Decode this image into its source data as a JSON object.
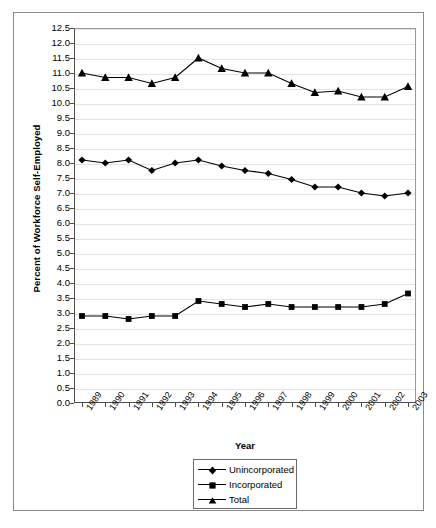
{
  "chart_data": {
    "type": "line",
    "title": "",
    "xlabel": "Year",
    "ylabel": "Percent of Workforce Self-Employed",
    "categories": [
      "1989",
      "1990",
      "1991",
      "1992",
      "1993",
      "1994",
      "1995",
      "1996",
      "1997",
      "1998",
      "1999",
      "2000",
      "2001",
      "2002",
      "2003"
    ],
    "ylim": [
      0.0,
      12.5
    ],
    "ytick_step": 0.5,
    "ytick_labels": [
      "0.0",
      "0.5",
      "1.0",
      "1.5",
      "2.0",
      "2.5",
      "3.0",
      "3.5",
      "4.0",
      "4.5",
      "5.0",
      "5.5",
      "6.0",
      "6.5",
      "7.0",
      "7.5",
      "8.0",
      "8.5",
      "9.0",
      "9.5",
      "10.0",
      "10.5",
      "11.0",
      "11.5",
      "12.0",
      "12.5"
    ],
    "grid": true,
    "legend_position": "bottom-center",
    "series": [
      {
        "name": "Unincorporated",
        "marker": "diamond",
        "color": "#000000",
        "values": [
          8.1,
          8.0,
          8.1,
          7.75,
          8.0,
          8.1,
          7.9,
          7.75,
          7.65,
          7.45,
          7.2,
          7.2,
          7.0,
          6.9,
          7.0
        ]
      },
      {
        "name": "Incorporated",
        "marker": "square",
        "color": "#000000",
        "values": [
          2.9,
          2.9,
          2.8,
          2.9,
          2.9,
          3.4,
          3.3,
          3.2,
          3.3,
          3.2,
          3.2,
          3.2,
          3.2,
          3.3,
          3.65
        ]
      },
      {
        "name": "Total",
        "marker": "triangle",
        "color": "#000000",
        "values": [
          11.0,
          10.85,
          10.85,
          10.65,
          10.85,
          11.5,
          11.15,
          11.0,
          11.0,
          10.65,
          10.35,
          10.4,
          10.2,
          10.2,
          10.55
        ]
      }
    ]
  },
  "legend": {
    "items": [
      {
        "label": "Unincorporated",
        "marker": "diamond"
      },
      {
        "label": "Incorporated",
        "marker": "square"
      },
      {
        "label": "Total",
        "marker": "triangle"
      }
    ]
  },
  "axes": {
    "y_title": "Percent of Workforce Self-Employed",
    "x_title": "Year"
  },
  "colors": {
    "series": "#000000",
    "gridline": "#e3e3e3",
    "axis": "#4d4d4d",
    "frame": "#8a8a8a",
    "background": "#ffffff"
  }
}
